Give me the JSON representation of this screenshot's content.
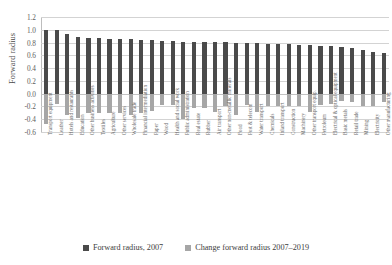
{
  "chart_data": {
    "type": "bar",
    "title": "",
    "xlabel": "",
    "ylabel": "Forward radius",
    "ylim": [
      -0.6,
      1.2
    ],
    "ytick_labels": [
      "1.2",
      "1.0",
      "0.8",
      "0.6",
      "0.4",
      "0.2",
      "0.0",
      "-0.2",
      "-0.4",
      "-0.6"
    ],
    "ytick_values": [
      1.2,
      1.0,
      0.8,
      0.6,
      0.4,
      0.2,
      0.0,
      -0.2,
      -0.4,
      -0.6
    ],
    "grid": true,
    "legend_position": "bottom",
    "categories": [
      "Transport equipment",
      "Leather",
      "Hotels and restaurants",
      "Education",
      "Other business activities",
      "Textiles",
      "Agriculture",
      "Other services",
      "Wholesale trade",
      "Financial intermediation",
      "Paper",
      "Wood",
      "Health and social work",
      "Public administration",
      "Real estate",
      "Rubber",
      "Air transport",
      "Other non-metallic minerals",
      "Food",
      "Post & telecom",
      "Water transport",
      "Chemicals",
      "Inland transport",
      "Construction",
      "Machinery",
      "Other transport equip.",
      "Petroleum",
      "Electrical & optical equipment",
      "Basic metals",
      "Retail trade",
      "Mining",
      "Electricity",
      "Other manufacturing"
    ],
    "series": [
      {
        "name": "Forward radius, 2007",
        "color": "#4a4a4a",
        "values": [
          1.0,
          0.99,
          0.94,
          0.88,
          0.87,
          0.87,
          0.86,
          0.86,
          0.85,
          0.84,
          0.84,
          0.83,
          0.82,
          0.81,
          0.81,
          0.81,
          0.81,
          0.81,
          0.8,
          0.8,
          0.79,
          0.78,
          0.78,
          0.77,
          0.76,
          0.76,
          0.75,
          0.74,
          0.73,
          0.72,
          0.68,
          0.65,
          0.63
        ]
      },
      {
        "name": "Change forward radius 2007–2019",
        "color": "#a6a6a6",
        "values": [
          -0.47,
          -0.16,
          -0.34,
          -0.38,
          -0.3,
          -0.3,
          -0.31,
          -0.31,
          -0.33,
          -0.31,
          -0.27,
          -0.18,
          -0.17,
          -0.39,
          -0.23,
          -0.22,
          -0.28,
          -0.2,
          -0.33,
          -0.18,
          -0.28,
          -0.19,
          -0.2,
          -0.2,
          -0.2,
          -0.28,
          -0.18,
          -0.16,
          -0.12,
          -0.13,
          -0.19,
          -0.19,
          -0.13
        ]
      }
    ]
  },
  "legend": {
    "items": [
      {
        "label": "Forward radius, 2007",
        "color": "#4a4a4a"
      },
      {
        "label": "Change forward radius 2007–2019",
        "color": "#a6a6a6"
      }
    ]
  }
}
